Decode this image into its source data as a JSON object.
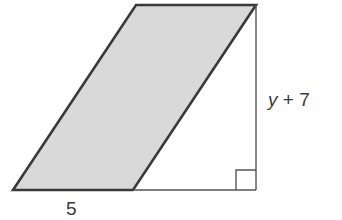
{
  "diagram": {
    "type": "geometry",
    "shape": "parallelogram inside right trapezoid region",
    "labels": {
      "base": "5",
      "height_var": "y",
      "height_op": "+",
      "height_const": "7"
    },
    "colors": {
      "fill": "#d9d9d9",
      "stroke": "#3a3a3a",
      "thin_stroke": "#555555"
    },
    "right_angle_marker": true
  }
}
